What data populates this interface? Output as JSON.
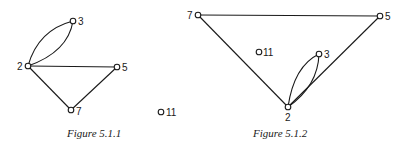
{
  "figures": [
    {
      "caption": "Figure 5.1.1",
      "nodes": [
        {
          "id": "2",
          "label": "2"
        },
        {
          "id": "3",
          "label": "3"
        },
        {
          "id": "5",
          "label": "5"
        },
        {
          "id": "7",
          "label": "7"
        },
        {
          "id": "11",
          "label": "11"
        }
      ],
      "edges": [
        {
          "from": "2",
          "to": "3",
          "multiplicity": 2
        },
        {
          "from": "2",
          "to": "5",
          "multiplicity": 1
        },
        {
          "from": "2",
          "to": "7",
          "multiplicity": 1
        },
        {
          "from": "7",
          "to": "5",
          "multiplicity": 1
        }
      ]
    },
    {
      "caption": "Figure 5.1.2",
      "nodes": [
        {
          "id": "7",
          "label": "7"
        },
        {
          "id": "5",
          "label": "5"
        },
        {
          "id": "11",
          "label": "11"
        },
        {
          "id": "3",
          "label": "3"
        },
        {
          "id": "2",
          "label": "2"
        }
      ],
      "edges": [
        {
          "from": "7",
          "to": "5",
          "multiplicity": 1
        },
        {
          "from": "7",
          "to": "2",
          "multiplicity": 1
        },
        {
          "from": "2",
          "to": "5",
          "multiplicity": 1
        },
        {
          "from": "2",
          "to": "3",
          "multiplicity": 2
        }
      ]
    }
  ]
}
